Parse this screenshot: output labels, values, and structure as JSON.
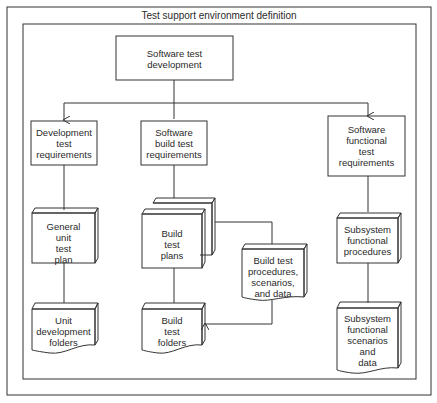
{
  "title": "Test support environment definition",
  "nodes": {
    "root": "Software test\ndevelopment",
    "dev_req": "Development\ntest\nrequirements",
    "build_req": "Software\nbuild test\nrequirements",
    "func_req": "Software\nfunctional\ntest\nrequirements",
    "unit_plan": "General\nunit\ntest\nplan",
    "build_plans": "Build\ntest\nplans",
    "build_procs": "Build test\nprocedures,\nscenarios,\nand data",
    "sub_procs": "Subsystem\nfunctional\nprocedures",
    "unit_folders": "Unit\ndevelopment\nfolders",
    "build_folders": "Build\ntest\nfolders",
    "sub_scen": "Subsystem\nfunctional\nscenarios\nand\ndata"
  },
  "colors": {
    "line": "#333333",
    "background": "#ffffff"
  }
}
